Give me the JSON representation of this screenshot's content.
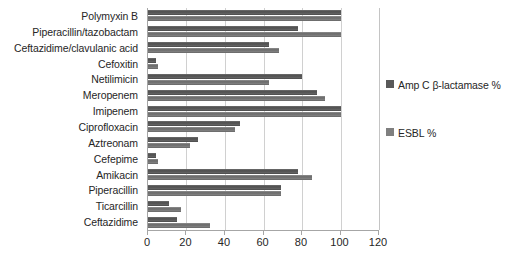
{
  "chart_data": {
    "type": "bar",
    "orientation": "horizontal",
    "title": "",
    "xlabel": "",
    "ylabel": "",
    "xlim": [
      0,
      120
    ],
    "grid": true,
    "legend_position": "right",
    "xticks": [
      "0",
      "20",
      "40",
      "60",
      "80",
      "100",
      "120"
    ],
    "xtick_values": [
      0,
      20,
      40,
      60,
      80,
      100,
      120
    ],
    "categories": [
      "Polymyxin B",
      "Piperacillin/tazobactam",
      "Ceftazidime/clavulanic acid",
      "Cefoxitin",
      "Netilimicin",
      "Meropenem",
      "Imipenem",
      "Ciprofloxacin",
      "Aztreonam",
      "Cefepime",
      "Amikacin",
      "Piperacillin",
      "Ticarcillin",
      "Ceftazidime"
    ],
    "series": [
      {
        "name": "Amp C β-lactamase %",
        "color": "#595959",
        "values": [
          100,
          78,
          63,
          4,
          80,
          88,
          100,
          48,
          26,
          4,
          78,
          69,
          11,
          15
        ]
      },
      {
        "name": "ESBL %",
        "color": "#7f7f7f",
        "values": [
          100,
          100,
          68,
          5,
          63,
          92,
          100,
          45,
          22,
          5,
          85,
          69,
          17,
          32
        ]
      }
    ]
  },
  "legend": {
    "entries": [
      {
        "label": "Amp C β-lactamase %",
        "color": "#595959"
      },
      {
        "label": "ESBL %",
        "color": "#7f7f7f"
      }
    ]
  }
}
